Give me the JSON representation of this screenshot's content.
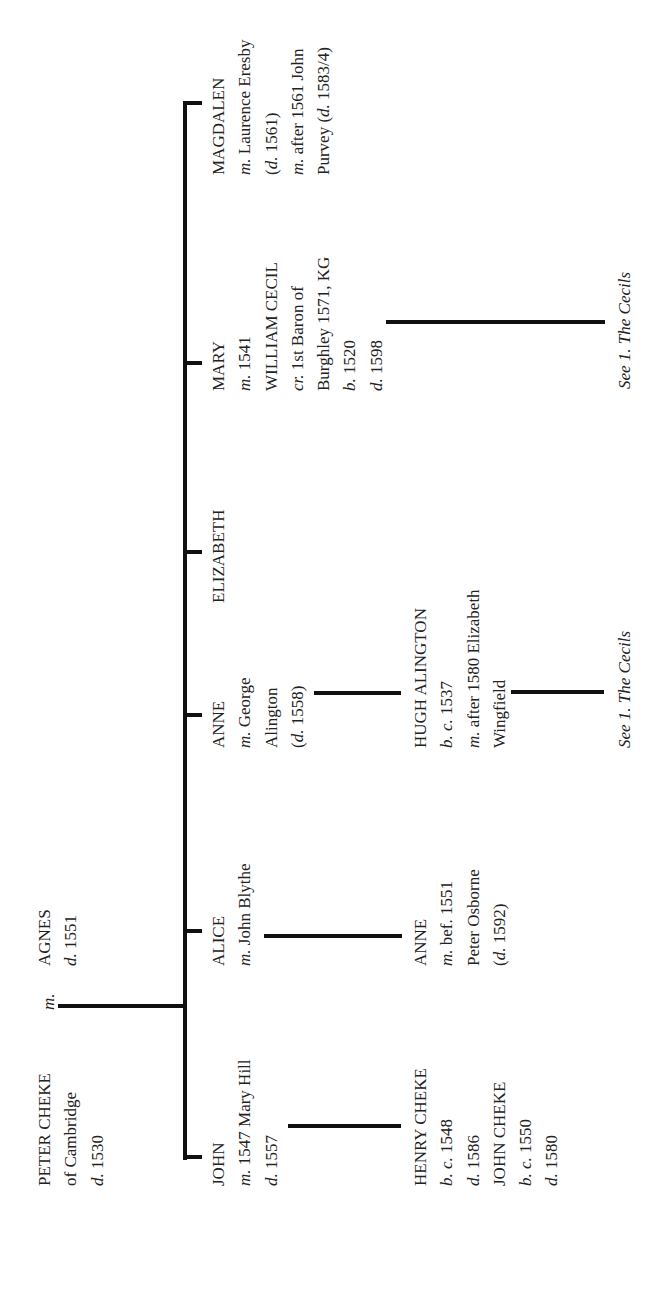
{
  "diagram": {
    "type": "family-tree",
    "orientation": "rotated-90-ccw",
    "line_color": "#111111",
    "text_color": "#222222"
  },
  "root": {
    "husband": {
      "lines": [
        [
          {
            "t": "PETER CHEKE"
          }
        ],
        [
          {
            "t": "of Cambridge"
          }
        ],
        [
          {
            "t": "d.",
            "i": true
          },
          {
            "t": " 1530"
          }
        ]
      ]
    },
    "marriage_label": "m.",
    "wife": {
      "lines": [
        [
          {
            "t": "AGNES"
          }
        ],
        [
          {
            "t": "d.",
            "i": true
          },
          {
            "t": " 1551"
          }
        ]
      ]
    }
  },
  "children": [
    {
      "id": "john",
      "lines": [
        [
          {
            "t": "JOHN"
          }
        ],
        [
          {
            "t": "m.",
            "i": true
          },
          {
            "t": " 1547 Mary Hill"
          }
        ],
        [
          {
            "t": "d.",
            "i": true
          },
          {
            "t": " 1557"
          }
        ]
      ]
    },
    {
      "id": "alice",
      "lines": [
        [
          {
            "t": "ALICE"
          }
        ],
        [
          {
            "t": "m.",
            "i": true
          },
          {
            "t": " John Blythe"
          }
        ]
      ]
    },
    {
      "id": "anne",
      "lines": [
        [
          {
            "t": "ANNE"
          }
        ],
        [
          {
            "t": "m.",
            "i": true
          },
          {
            "t": " George"
          }
        ],
        [
          {
            "t": "Alington"
          }
        ],
        [
          {
            "t": "("
          },
          {
            "t": "d.",
            "i": true
          },
          {
            "t": " 1558)"
          }
        ]
      ]
    },
    {
      "id": "elizabeth",
      "lines": [
        [
          {
            "t": "ELIZABETH"
          }
        ]
      ]
    },
    {
      "id": "mary",
      "lines": [
        [
          {
            "t": "MARY"
          }
        ],
        [
          {
            "t": "m.",
            "i": true
          },
          {
            "t": " 1541"
          }
        ],
        [
          {
            "t": "WILLIAM CECIL"
          }
        ],
        [
          {
            "t": "cr.",
            "i": true
          },
          {
            "t": " 1st Baron of"
          }
        ],
        [
          {
            "t": "Burghley 1571, KG"
          }
        ],
        [
          {
            "t": "b.",
            "i": true
          },
          {
            "t": " 1520"
          }
        ],
        [
          {
            "t": "d.",
            "i": true
          },
          {
            "t": " 1598"
          }
        ]
      ]
    },
    {
      "id": "magdalen",
      "lines": [
        [
          {
            "t": "MAGDALEN"
          }
        ],
        [
          {
            "t": "m.",
            "i": true
          },
          {
            "t": " Laurence Eresby"
          }
        ],
        [
          {
            "t": "("
          },
          {
            "t": "d.",
            "i": true
          },
          {
            "t": " 1561)"
          }
        ],
        [
          {
            "t": "m.",
            "i": true
          },
          {
            "t": " after 1561 John"
          }
        ],
        [
          {
            "t": "Purvey ("
          },
          {
            "t": "d.",
            "i": true
          },
          {
            "t": " 1583/4)"
          }
        ]
      ]
    }
  ],
  "grandchildren": [
    {
      "id": "henry-john-cheke",
      "parent": "john",
      "lines": [
        [
          {
            "t": "HENRY CHEKE"
          }
        ],
        [
          {
            "t": "b. c.",
            "i": true
          },
          {
            "t": " 1548"
          }
        ],
        [
          {
            "t": "d.",
            "i": true
          },
          {
            "t": " 1586"
          }
        ],
        [
          {
            "t": "JOHN CHEKE"
          }
        ],
        [
          {
            "t": "b. c.",
            "i": true
          },
          {
            "t": " 1550"
          }
        ],
        [
          {
            "t": "d.",
            "i": true
          },
          {
            "t": " 1580"
          }
        ]
      ]
    },
    {
      "id": "anne-osborne",
      "parent": "alice",
      "lines": [
        [
          {
            "t": "ANNE"
          }
        ],
        [
          {
            "t": "m.",
            "i": true
          },
          {
            "t": " bef. 1551"
          }
        ],
        [
          {
            "t": "Peter Osborne"
          }
        ],
        [
          {
            "t": "("
          },
          {
            "t": "d.",
            "i": true
          },
          {
            "t": " 1592)"
          }
        ]
      ]
    },
    {
      "id": "hugh-alington",
      "parent": "anne",
      "lines": [
        [
          {
            "t": "HUGH ALINGTON"
          }
        ],
        [
          {
            "t": "b. c.",
            "i": true
          },
          {
            "t": " 1537"
          }
        ],
        [
          {
            "t": "m.",
            "i": true
          },
          {
            "t": " after 1580 Elizabeth"
          }
        ],
        [
          {
            "t": "Wingfield"
          }
        ]
      ]
    }
  ],
  "references": [
    {
      "id": "see-cecils-hugh",
      "from": "hugh-alington",
      "text": "See 1. The Cecils"
    },
    {
      "id": "see-cecils-mary",
      "from": "mary",
      "text": "See 1. The Cecils"
    }
  ]
}
